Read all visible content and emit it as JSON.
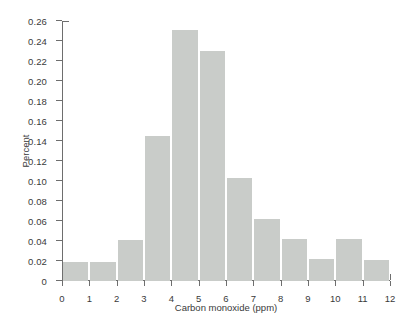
{
  "chart_data": {
    "type": "bar",
    "title": "",
    "subtitle": "",
    "xlabel": "Carbon monoxide (ppm)",
    "ylabel": "Percent",
    "xlim": [
      0,
      12
    ],
    "ylim": [
      0,
      0.26
    ],
    "grid": false,
    "legend": null,
    "bin_width": 1,
    "bar_color": "#c9ccc9",
    "axis_color": "#6e6e6e",
    "background_color": "#ffffff",
    "bin_edges": [
      0,
      1,
      2,
      3,
      4,
      5,
      6,
      7,
      8,
      9,
      10,
      11,
      12
    ],
    "categories": [
      "0-1",
      "1-2",
      "2-3",
      "3-4",
      "4-5",
      "5-6",
      "6-7",
      "7-8",
      "8-9",
      "9-10",
      "10-11",
      "11-12"
    ],
    "values": [
      0.019,
      0.019,
      0.041,
      0.145,
      0.251,
      0.23,
      0.103,
      0.062,
      0.042,
      0.022,
      0.042,
      0.021
    ],
    "xticks": [
      {
        "value": 0,
        "label": "0"
      },
      {
        "value": 1,
        "label": "1"
      },
      {
        "value": 2,
        "label": "2"
      },
      {
        "value": 3,
        "label": "3"
      },
      {
        "value": 4,
        "label": "4"
      },
      {
        "value": 5,
        "label": "5"
      },
      {
        "value": 6,
        "label": "6"
      },
      {
        "value": 7,
        "label": "7"
      },
      {
        "value": 8,
        "label": "8"
      },
      {
        "value": 9,
        "label": "9"
      },
      {
        "value": 10,
        "label": "10"
      },
      {
        "value": 11,
        "label": "11"
      },
      {
        "value": 12,
        "label": "12"
      }
    ],
    "yticks": [
      {
        "value": 0,
        "label": "0"
      },
      {
        "value": 0.02,
        "label": "0.02"
      },
      {
        "value": 0.04,
        "label": "0.04"
      },
      {
        "value": 0.06,
        "label": "0.06"
      },
      {
        "value": 0.08,
        "label": "0.08"
      },
      {
        "value": 0.1,
        "label": "0.10"
      },
      {
        "value": 0.12,
        "label": "0.12"
      },
      {
        "value": 0.14,
        "label": "0.14"
      },
      {
        "value": 0.16,
        "label": "0.16"
      },
      {
        "value": 0.18,
        "label": "0.18"
      },
      {
        "value": 0.2,
        "label": "0.20"
      },
      {
        "value": 0.22,
        "label": "0.22"
      },
      {
        "value": 0.24,
        "label": "0.24"
      },
      {
        "value": 0.26,
        "label": "0.26"
      }
    ]
  }
}
